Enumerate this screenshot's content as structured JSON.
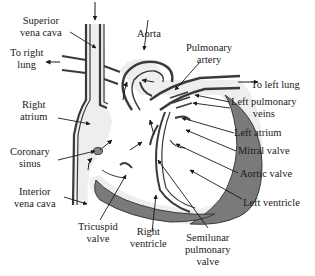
{
  "diagram": {
    "colors": {
      "outline": "#3a3a3a",
      "wall_dark": "#7a7a7a",
      "chamber_fill": "#eeeeee",
      "background": "#ffffff"
    },
    "labels": {
      "superior_vena_cava": [
        "Superior",
        "vena cava"
      ],
      "to_right_lung": [
        "To right",
        "lung"
      ],
      "right_atrium": [
        "Right",
        "atrium"
      ],
      "coronary_sinus": [
        "Coronary",
        "sinus"
      ],
      "interior_vena_cava": [
        "Interior",
        "vena cava"
      ],
      "tricuspid_valve": [
        "Tricuspid",
        "valve"
      ],
      "right_ventricle": [
        "Right",
        "ventricle"
      ],
      "semilunar_pulmonary_valve": [
        "Semilunar",
        "pulmonary",
        "valve"
      ],
      "aorta": [
        "Aorta"
      ],
      "pulmonary_artery": [
        "Pulmonary",
        "artery"
      ],
      "to_left_lung": [
        "To left lung"
      ],
      "left_pulmonary_veins": [
        "Left pulmonary",
        "veins"
      ],
      "left_atrium": [
        "Left atrium"
      ],
      "mitral_valve": [
        "Mitral valve"
      ],
      "aortic_valve": [
        "Aortic valve"
      ],
      "left_ventricle": [
        "Left ventricle"
      ]
    }
  }
}
